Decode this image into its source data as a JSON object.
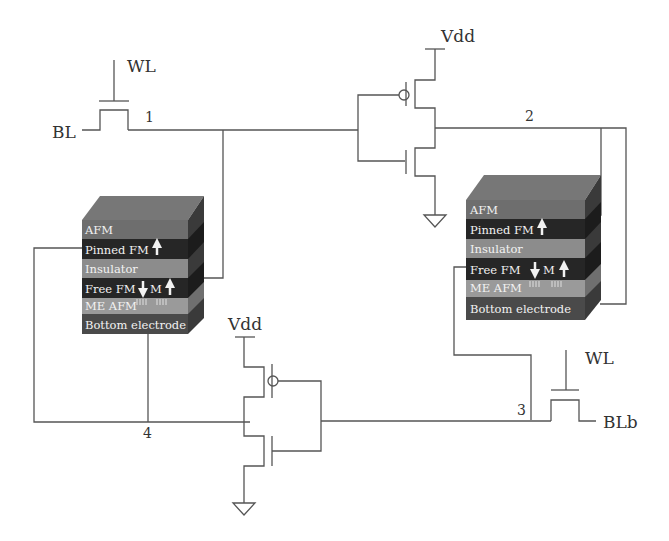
{
  "diagram": {
    "labels": {
      "wl_left": "WL",
      "bl": "BL",
      "wl_right": "WL",
      "blb": "BLb",
      "vdd_top": "Vdd",
      "vdd_bottom": "Vdd"
    },
    "nodes": [
      "1",
      "2",
      "3",
      "4"
    ],
    "stack_left": {
      "layers": [
        {
          "name": "AFM",
          "color": "#6e6e6e"
        },
        {
          "name": "Pinned FM",
          "color": "#262626",
          "arrow": "up"
        },
        {
          "name": "Insulator",
          "color": "#8c8c8c"
        },
        {
          "name": "Free FM",
          "color": "#262626",
          "arrows": "down-M-up",
          "m_label": "M"
        },
        {
          "name": "ME AFM",
          "color": "#9a9a9a"
        },
        {
          "name": "Bottom electrode",
          "color": "#4a4a4a"
        }
      ]
    },
    "stack_right": {
      "layers": [
        {
          "name": "AFM",
          "color": "#6e6e6e"
        },
        {
          "name": "Pinned FM",
          "color": "#262626",
          "arrow": "up"
        },
        {
          "name": "Insulator",
          "color": "#8c8c8c"
        },
        {
          "name": "Free FM",
          "color": "#262626",
          "arrows": "down-M-up",
          "m_label": "M"
        },
        {
          "name": "ME AFM",
          "color": "#9a9a9a"
        },
        {
          "name": "Bottom electrode",
          "color": "#4a4a4a"
        }
      ]
    }
  }
}
